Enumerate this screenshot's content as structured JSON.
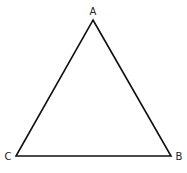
{
  "diagram": {
    "type": "triangle",
    "stroke_color": "#111111",
    "background": "#ffffff",
    "vertices": [
      {
        "label": "A",
        "x": 93,
        "y": 20,
        "label_x": 93,
        "label_y": 15
      },
      {
        "label": "B",
        "x": 171,
        "y": 156,
        "label_x": 179,
        "label_y": 160
      },
      {
        "label": "C",
        "x": 16,
        "y": 156,
        "label_x": 8,
        "label_y": 160
      }
    ]
  }
}
